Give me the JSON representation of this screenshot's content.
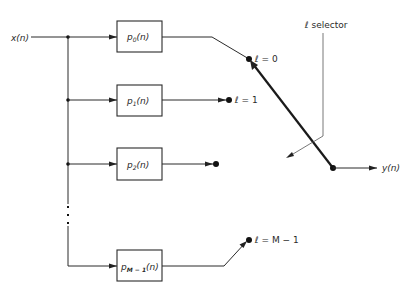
{
  "diagram": {
    "type": "block-diagram",
    "input_label": "x(n)",
    "output_label": "y(n)",
    "selector_label": "ℓ selector",
    "filters": [
      {
        "id": "p0",
        "label_base": "p",
        "label_sub": "0",
        "label_arg": "(n)",
        "switch_label": "ℓ = 0"
      },
      {
        "id": "p1",
        "label_base": "p",
        "label_sub": "1",
        "label_arg": "(n)",
        "switch_label": "ℓ = 1"
      },
      {
        "id": "p2",
        "label_base": "p",
        "label_sub": "2",
        "label_arg": "(n)",
        "switch_label": ""
      },
      {
        "id": "pM-1",
        "label_base": "p",
        "label_sub": "M − 1",
        "label_arg": "(n)",
        "switch_label": "ℓ = M − 1"
      }
    ],
    "ellipsis": "⋮",
    "colors": {
      "line": "#2a2a2a",
      "background": "#ffffff"
    }
  }
}
